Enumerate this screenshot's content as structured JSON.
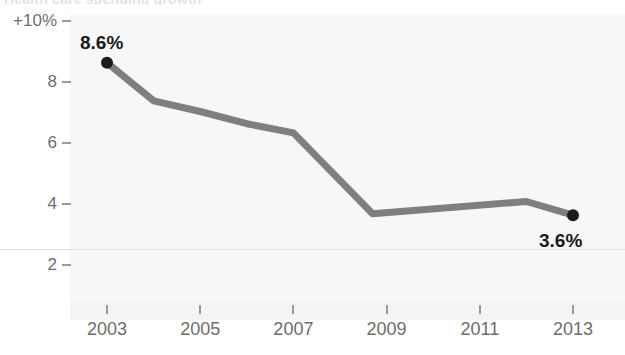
{
  "title_remnant": "Health care spending growth",
  "colors": {
    "line": "#7f7f7f",
    "marker": "#1a1a1a",
    "tick": "#9a9a9a",
    "tick_label": "#6d6d6d",
    "gridline": "#dedede",
    "plot_background": "#f7f7f7",
    "page_background": "#ffffff",
    "value_label": "#1a1a1a"
  },
  "chart_data": {
    "type": "line",
    "title": "",
    "xlabel": "",
    "ylabel": "",
    "xlim": [
      2002.4,
      2013.6
    ],
    "ylim": [
      1.3,
      10.0
    ],
    "grid": true,
    "legend": "none",
    "y_ticks": [
      {
        "value": 10,
        "label": "+10%"
      },
      {
        "value": 8,
        "label": "8"
      },
      {
        "value": 6,
        "label": "6"
      },
      {
        "value": 4,
        "label": "4"
      },
      {
        "value": 2,
        "label": "2"
      }
    ],
    "x_ticks": [
      {
        "value": 2003,
        "label": "2003"
      },
      {
        "value": 2005,
        "label": "2005"
      },
      {
        "value": 2007,
        "label": "2007"
      },
      {
        "value": 2009,
        "label": "2009"
      },
      {
        "value": 2011,
        "label": "2011"
      },
      {
        "value": 2013,
        "label": "2013"
      }
    ],
    "gridlines": [
      2.5
    ],
    "x": [
      2003,
      2004,
      2005,
      2006,
      2007,
      2008.7,
      2012,
      2013
    ],
    "values": [
      8.6,
      7.35,
      7.0,
      6.6,
      6.3,
      3.65,
      4.05,
      3.6
    ],
    "series": [
      {
        "name": "Spending growth",
        "x": [
          2003,
          2004,
          2005,
          2006,
          2007,
          2008.7,
          2012,
          2013
        ],
        "values": [
          8.6,
          7.35,
          7.0,
          6.6,
          6.3,
          3.65,
          4.05,
          3.6
        ]
      }
    ],
    "annotations": [
      {
        "name": "start-value",
        "x": 2003,
        "value": 8.6,
        "label": "8.6%",
        "position": "above"
      },
      {
        "name": "end-value",
        "x": 2013,
        "value": 3.6,
        "label": "3.6%",
        "position": "below"
      }
    ],
    "markers": [
      {
        "x": 2003,
        "value": 8.6
      },
      {
        "x": 2013,
        "value": 3.6
      }
    ]
  }
}
